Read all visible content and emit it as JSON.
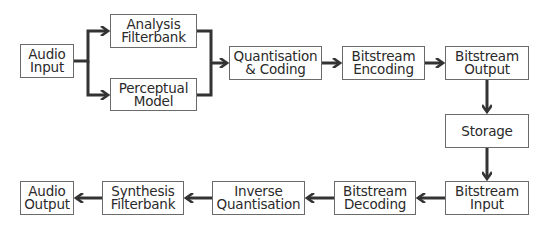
{
  "diagram": {
    "type": "block-flow",
    "colors": {
      "line": "#333333",
      "box_border": "#6a6a6a",
      "text": "#2a2a2a",
      "background": "#ffffff"
    },
    "nodes": [
      {
        "id": "audio_input",
        "label": "Audio\nInput",
        "x": 20,
        "y": 44,
        "w": 54,
        "h": 34
      },
      {
        "id": "analysis_filterbank",
        "label": "Analysis\nFilterbank",
        "x": 110,
        "y": 14,
        "w": 87,
        "h": 34
      },
      {
        "id": "perceptual_model",
        "label": "Perceptual\nModel",
        "x": 110,
        "y": 78,
        "w": 87,
        "h": 33
      },
      {
        "id": "quantisation_coding",
        "label": "Quantisation\n& Coding",
        "x": 229,
        "y": 46,
        "w": 93,
        "h": 34
      },
      {
        "id": "bitstream_encoding",
        "label": "Bitstream\nEncoding",
        "x": 342,
        "y": 46,
        "w": 83,
        "h": 34
      },
      {
        "id": "bitstream_output",
        "label": "Bitstream\nOutput",
        "x": 445,
        "y": 46,
        "w": 84,
        "h": 34
      },
      {
        "id": "storage",
        "label": "Storage",
        "x": 445,
        "y": 114,
        "w": 84,
        "h": 34
      },
      {
        "id": "bitstream_input",
        "label": "Bitstream\nInput",
        "x": 445,
        "y": 181,
        "w": 84,
        "h": 34
      },
      {
        "id": "bitstream_decoding",
        "label": "Bitstream\nDecoding",
        "x": 334,
        "y": 181,
        "w": 82,
        "h": 34
      },
      {
        "id": "inverse_quantisation",
        "label": "Inverse\nQuantisation",
        "x": 212,
        "y": 181,
        "w": 93,
        "h": 34
      },
      {
        "id": "synthesis_filterbank",
        "label": "Synthesis\nFilterbank",
        "x": 102,
        "y": 181,
        "w": 82,
        "h": 34
      },
      {
        "id": "audio_output",
        "label": "Audio\nOutput",
        "x": 20,
        "y": 181,
        "w": 54,
        "h": 34
      }
    ],
    "edges": [
      {
        "from": "audio_input",
        "to": "analysis_filterbank"
      },
      {
        "from": "audio_input",
        "to": "perceptual_model"
      },
      {
        "from": "analysis_filterbank",
        "to": "quantisation_coding"
      },
      {
        "from": "perceptual_model",
        "to": "quantisation_coding"
      },
      {
        "from": "quantisation_coding",
        "to": "bitstream_encoding"
      },
      {
        "from": "bitstream_encoding",
        "to": "bitstream_output"
      },
      {
        "from": "bitstream_output",
        "to": "storage"
      },
      {
        "from": "storage",
        "to": "bitstream_input"
      },
      {
        "from": "bitstream_input",
        "to": "bitstream_decoding"
      },
      {
        "from": "bitstream_decoding",
        "to": "inverse_quantisation"
      },
      {
        "from": "inverse_quantisation",
        "to": "synthesis_filterbank"
      },
      {
        "from": "synthesis_filterbank",
        "to": "audio_output"
      }
    ]
  }
}
